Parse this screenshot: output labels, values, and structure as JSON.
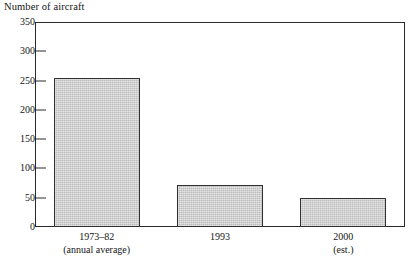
{
  "chart_data": {
    "type": "bar",
    "title": "",
    "ylabel": "Number of aircraft",
    "xlabel": "",
    "categories": [
      "1973–82",
      "1993",
      "2000"
    ],
    "category_sublabels": [
      "(annual average)",
      "",
      "(est.)"
    ],
    "values": [
      255,
      72,
      49
    ],
    "ylim": [
      0,
      350
    ],
    "yticks": [
      0,
      50,
      100,
      150,
      200,
      250,
      300,
      350
    ],
    "ytick_labels": [
      "0",
      "50",
      "100",
      "150",
      "200",
      "250",
      "300",
      "350"
    ],
    "grid": false,
    "legend": false,
    "bar_fill_color": "#c9c9c9",
    "bar_edge_color": "#303030",
    "axis_color": "#2a2a2a",
    "background_color": "#ffffff"
  }
}
